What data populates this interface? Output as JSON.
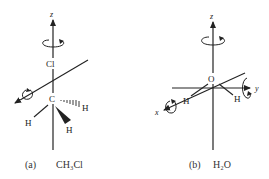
{
  "figure": {
    "panel_a": {
      "caption_tag": "(a)",
      "caption_formula": "CH₃Cl",
      "axis_labels": {
        "z": "z"
      },
      "atoms": {
        "cl": "Cl",
        "c": "C",
        "h_right": "H",
        "h_left": "H",
        "h_front": "H"
      }
    },
    "panel_b": {
      "caption_tag": "(b)",
      "caption_formula": "H₂O",
      "axis_labels": {
        "z": "z",
        "y": "y",
        "x": "x"
      },
      "atoms": {
        "o": "O",
        "h_left": "H",
        "h_right": "H"
      }
    },
    "colors": {
      "line": "#222222",
      "background": "#ffffff"
    }
  }
}
